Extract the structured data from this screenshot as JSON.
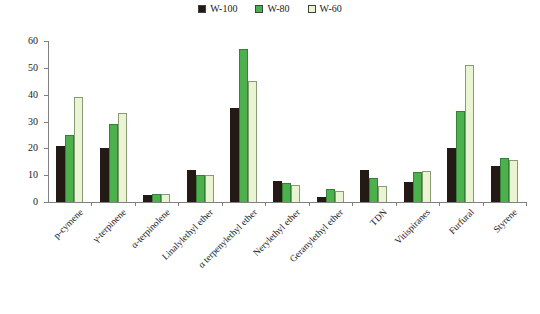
{
  "legend": {
    "position": "top-center",
    "entries": [
      {
        "label": "W-100",
        "color": "#231a15"
      },
      {
        "label": "W-80",
        "color": "#4cb04c"
      },
      {
        "label": "W-60",
        "color": "#e9f5d2"
      }
    ]
  },
  "axes": {
    "y_ticks": [
      "0",
      "10",
      "20",
      "30",
      "40",
      "50",
      "60"
    ],
    "y_min": 0,
    "y_max": 60,
    "y_step": 10
  },
  "chart_data": {
    "type": "bar",
    "title": "",
    "subtitle": "",
    "xlabel": "",
    "ylabel": "",
    "ylim": [
      0,
      60
    ],
    "grid": false,
    "legend_position": "top-center",
    "categories": [
      "p-cymene",
      "γ-terpinene",
      "α-terpinolene",
      "Linalylethyl ether",
      "α terpenylethyl ether",
      "Nerylethyl ether",
      "Geranylethyl ether",
      "TDN",
      "Vitispiranes",
      "Furfural",
      "Styrene"
    ],
    "series": [
      {
        "name": "W-100",
        "color": "#231a15",
        "values": [
          21,
          20,
          2.5,
          12,
          35,
          8,
          2,
          12,
          7.5,
          20,
          13.5
        ]
      },
      {
        "name": "W-80",
        "color": "#4cb04c",
        "values": [
          25,
          29,
          3,
          10,
          57,
          7,
          5,
          9,
          11,
          34,
          16.5
        ]
      },
      {
        "name": "W-60",
        "color": "#e9f5d2",
        "values": [
          39,
          33,
          3,
          10,
          45,
          6.5,
          4,
          6,
          11.5,
          51,
          15.5
        ]
      }
    ]
  }
}
